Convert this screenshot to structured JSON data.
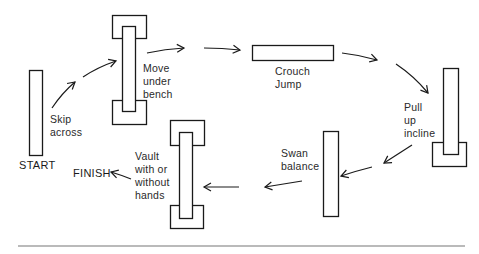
{
  "diagram": {
    "type": "circuit-course",
    "stations": [
      {
        "id": "start",
        "label": "START"
      },
      {
        "id": "skip",
        "label": "Skip\nacross"
      },
      {
        "id": "bench1",
        "label": "Move\nunder\nbench"
      },
      {
        "id": "crouch",
        "label": "Crouch\nJump"
      },
      {
        "id": "incline",
        "label": "Pull\nup\nincline"
      },
      {
        "id": "swan",
        "label": "Swan\nbalance"
      },
      {
        "id": "vault",
        "label": "Vault\nwith or\nwithout\nhands"
      },
      {
        "id": "finish",
        "label": "FINISH"
      }
    ],
    "flow": [
      "START",
      "Skip across",
      "Move under bench",
      "Crouch Jump",
      "Pull up incline",
      "Swan balance",
      "Vault with or without hands",
      "FINISH"
    ],
    "colors": {
      "stroke": "#1a1a1a",
      "rule": "#777777",
      "background": "#ffffff"
    }
  }
}
